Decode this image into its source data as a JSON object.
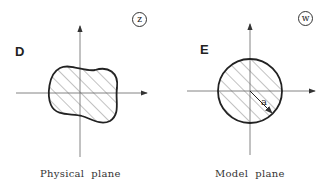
{
  "left_panel": {
    "region_label": "D",
    "plane_badge": "z",
    "caption": "Physical  plane",
    "shape": "irregular-blob"
  },
  "right_panel": {
    "region_label": "E",
    "plane_badge": "w",
    "caption": "Model  plane",
    "shape": "circle",
    "radius_label": "a"
  },
  "colors": {
    "stroke": "#222222",
    "axis": "#777777",
    "hatch": "#666666",
    "background": "#ffffff"
  }
}
